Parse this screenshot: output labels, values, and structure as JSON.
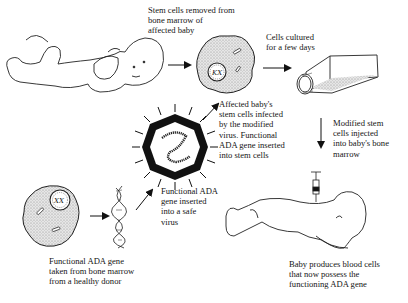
{
  "diagram": {
    "labels": {
      "stem_cells_removed": "Stem cells removed from\nbone marrow of\naffected baby",
      "cells_cultured": "Cells cultured\nfor a few days",
      "stem_cells_infected": "Affected baby's\nstem cells infected\nby the modified\nvirus. Functional\nADA gene inserted\ninto stem cells",
      "modified_injected": "Modified stem\ncells injected\ninto baby's bone\nmarrow",
      "gene_inserted_virus": "Functional ADA\ngene inserted\ninto a safe\nvirus",
      "gene_from_donor": "Functional ADA gene\ntaken from bone marrow\nfrom a healthy donor",
      "baby_produces": "Baby produces blood cells\nthat now possess the\nfunctioning ADA gene"
    },
    "nodes": [
      {
        "id": "affected-baby",
        "icon": "baby-lying-icon"
      },
      {
        "id": "stem-cell",
        "icon": "stem-cell-icon"
      },
      {
        "id": "culture-flask",
        "icon": "culture-flask-icon"
      },
      {
        "id": "safe-virus",
        "icon": "virus-icon"
      },
      {
        "id": "donor-cell",
        "icon": "donor-cell-icon"
      },
      {
        "id": "dna-helix",
        "icon": "dna-helix-icon"
      },
      {
        "id": "treated-baby",
        "icon": "baby-crawling-icon"
      },
      {
        "id": "syringe",
        "icon": "syringe-icon"
      }
    ],
    "edges": [
      {
        "from": "affected-baby",
        "to": "stem-cell"
      },
      {
        "from": "stem-cell",
        "to": "culture-flask"
      },
      {
        "from": "culture-flask",
        "to": "treated-baby"
      },
      {
        "from": "donor-cell",
        "to": "dna-helix"
      },
      {
        "from": "dna-helix",
        "to": "safe-virus"
      },
      {
        "from": "safe-virus",
        "to": "stem-cell"
      }
    ],
    "colors": {
      "ink": "#111111",
      "stipple": "#c8c8c8",
      "background": "#ffffff"
    }
  }
}
